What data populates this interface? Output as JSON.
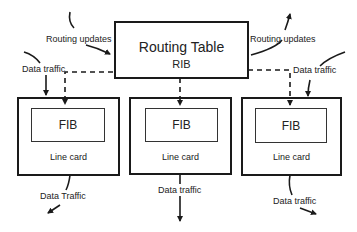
{
  "routing_table": {
    "title": "Routing Table",
    "subtitle": "RIB"
  },
  "line_cards": [
    {
      "fib_label": "FIB",
      "label": "Line card"
    },
    {
      "fib_label": "FIB",
      "label": "Line card"
    },
    {
      "fib_label": "FIB",
      "label": "Line card"
    }
  ],
  "annotations": {
    "routing_updates_left": "Routing updates",
    "routing_updates_right": "Routing updates",
    "data_traffic_in_left": "Data traffic",
    "data_traffic_in_right": "Data traffic",
    "data_traffic_out_left": "Data Traffic",
    "data_traffic_out_middle": "Data traffic",
    "data_traffic_out_right": "Data traffic"
  },
  "colors": {
    "stroke": "#1a1a1a",
    "background": "#ffffff"
  }
}
